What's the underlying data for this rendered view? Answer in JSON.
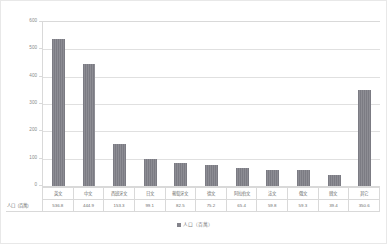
{
  "chart_data": {
    "type": "bar",
    "title": "",
    "xlabel": "",
    "ylabel": "",
    "ylim": [
      0,
      600
    ],
    "yticks": [
      "0",
      "100",
      "200",
      "300",
      "400",
      "500",
      "600"
    ],
    "grid": true,
    "legend_position": "bottom",
    "legend": [
      "人口（百萬）"
    ],
    "categories": [
      "英文",
      "中文",
      "西班牙文",
      "日文",
      "葡萄牙文",
      "德文",
      "阿拉伯文",
      "法文",
      "俄文",
      "韓文",
      "其它"
    ],
    "series": [
      {
        "name": "人口（百萬）",
        "values": [
          536.8,
          444.9,
          153.3,
          99.1,
          82.5,
          75.2,
          65.4,
          59.8,
          59.3,
          39.4,
          350.6
        ]
      }
    ]
  },
  "table": {
    "row_header": "人口（百萬）"
  },
  "colors": {
    "bar": "#83838b",
    "gridline": "#e0e0e0",
    "axis_text": "#8a8a8a",
    "table_border": "#d9d9d9"
  }
}
